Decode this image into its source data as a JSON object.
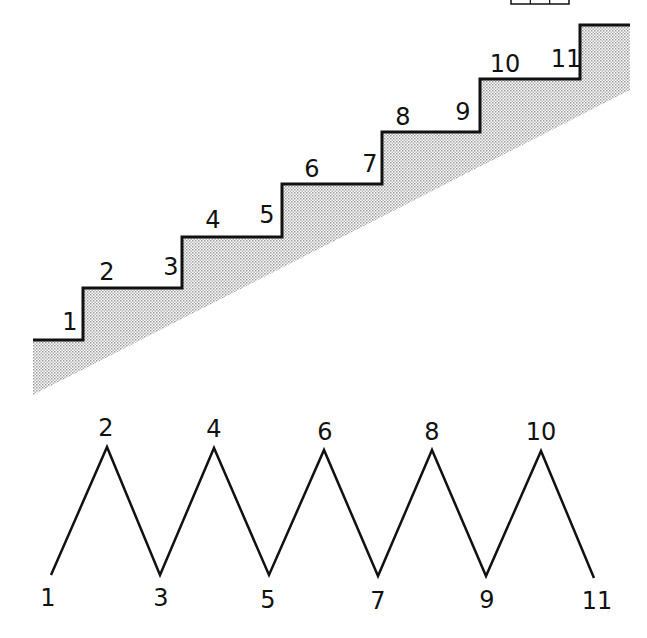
{
  "diagram": {
    "colors": {
      "line": "#111111",
      "shade": "#c8c8c8",
      "background": "#ffffff"
    },
    "staircase": {
      "labels": [
        {
          "text": "1",
          "x": 70,
          "y": 330
        },
        {
          "text": "2",
          "x": 107,
          "y": 280
        },
        {
          "text": "3",
          "x": 171,
          "y": 275
        },
        {
          "text": "4",
          "x": 213,
          "y": 228
        },
        {
          "text": "5",
          "x": 267,
          "y": 223
        },
        {
          "text": "6",
          "x": 312,
          "y": 177
        },
        {
          "text": "7",
          "x": 370,
          "y": 172
        },
        {
          "text": "8",
          "x": 403,
          "y": 125
        },
        {
          "text": "9",
          "x": 463,
          "y": 120
        },
        {
          "text": "10",
          "x": 505,
          "y": 72
        },
        {
          "text": "11",
          "x": 566,
          "y": 67
        }
      ],
      "outline_points": "33,340 83,340 83,288 182,288 182,237 282,237 282,184 382,184 382,132 480,132 480,79 580,79 580,25 630,25",
      "shade_points": "33,340 83,340 83,288 182,288 182,237 282,237 282,184 382,184 382,132 480,132 480,79 580,79 580,25 630,25 630,90 33,395"
    },
    "zigzag": {
      "points": "51,575 107,447 160,575 214,448 269,575 324,450 378,576 432,450 486,576 541,451 594,578",
      "labels": [
        {
          "text": "1",
          "x": 48,
          "y": 606
        },
        {
          "text": "2",
          "x": 106,
          "y": 436
        },
        {
          "text": "3",
          "x": 161,
          "y": 606
        },
        {
          "text": "4",
          "x": 214,
          "y": 437
        },
        {
          "text": "5",
          "x": 268,
          "y": 608
        },
        {
          "text": "6",
          "x": 325,
          "y": 440
        },
        {
          "text": "7",
          "x": 378,
          "y": 609
        },
        {
          "text": "8",
          "x": 432,
          "y": 440
        },
        {
          "text": "9",
          "x": 487,
          "y": 608
        },
        {
          "text": "10",
          "x": 541,
          "y": 440
        },
        {
          "text": "11",
          "x": 597,
          "y": 609
        }
      ]
    },
    "corner_box": {
      "x": 511,
      "y": 0,
      "width": 58,
      "height": 4,
      "cells": 3
    }
  }
}
